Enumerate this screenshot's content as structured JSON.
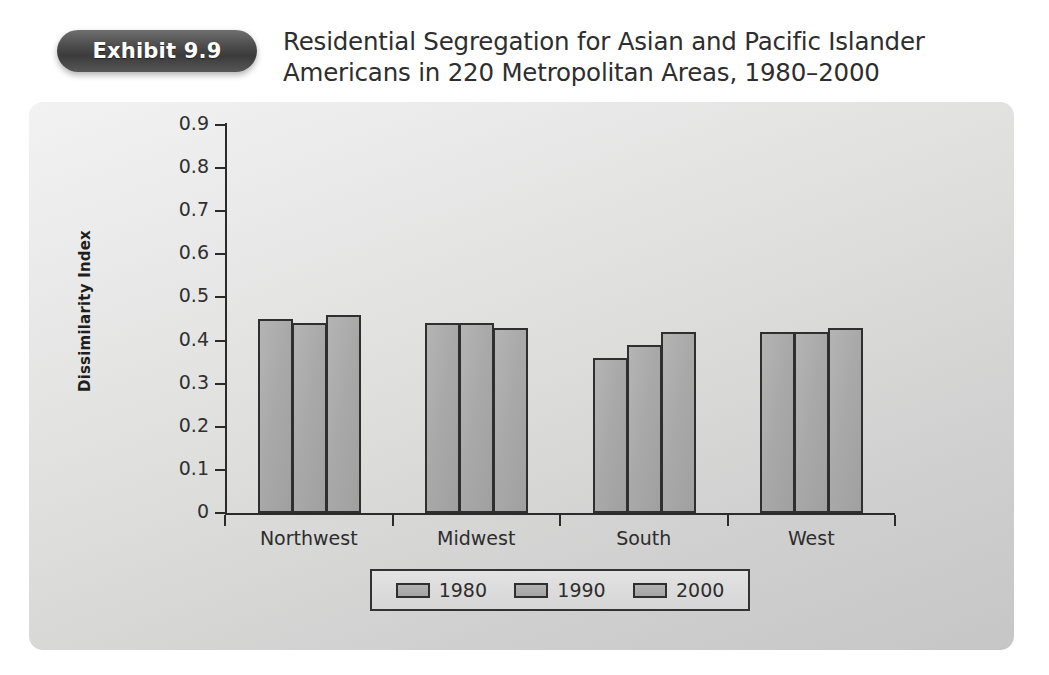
{
  "header": {
    "badge_label": "Exhibit 9.9",
    "title_line1": "Residential Segregation for Asian and Pacific Islander",
    "title_line2": "Americans in 220 Metropolitan Areas, 1980–2000"
  },
  "chart_data": {
    "type": "bar",
    "title": "Residential Segregation for Asian and Pacific Islander Americans in 220 Metropolitan Areas, 1980–2000",
    "xlabel": "",
    "ylabel": "Dissimilarity Index",
    "ylim": [
      0,
      0.9
    ],
    "ytick_labels": [
      "0",
      "0.1",
      "0.2",
      "0.3",
      "0.4",
      "0.5",
      "0.6",
      "0.7",
      "0.8",
      "0.9"
    ],
    "ytick_values": [
      0,
      0.1,
      0.2,
      0.3,
      0.4,
      0.5,
      0.6,
      0.7,
      0.8,
      0.9
    ],
    "grid": false,
    "legend_position": "bottom",
    "categories": [
      "Northwest",
      "Midwest",
      "South",
      "West"
    ],
    "series": [
      {
        "name": "1980",
        "values": [
          0.45,
          0.44,
          0.36,
          0.42
        ]
      },
      {
        "name": "1990",
        "values": [
          0.44,
          0.44,
          0.39,
          0.42
        ]
      },
      {
        "name": "2000",
        "values": [
          0.46,
          0.43,
          0.42,
          0.43
        ]
      }
    ],
    "colors": {
      "bar_fill": "#a9a9a9",
      "bar_border": "#2f2f2f",
      "panel_background": "#dedede",
      "axis": "#2b2b2b",
      "badge_background": "#4c4c4c"
    }
  }
}
